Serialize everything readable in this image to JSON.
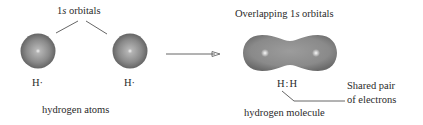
{
  "left_panel": {
    "orbital_label_prefix": "1",
    "orbital_label_italic": "s",
    "orbital_label_suffix": " orbitals",
    "atom_left_label": "H·",
    "atom_right_label": "H·",
    "caption": "hydrogen atoms"
  },
  "right_panel": {
    "overlap_label_prefix": "Overlapping 1",
    "overlap_label_italic": "s",
    "overlap_label_suffix": " orbitals",
    "molecule_formula": "H:H",
    "shared_pair_line1": "Shared pair",
    "shared_pair_line2": "of electrons",
    "caption": "hydrogen molecule"
  },
  "colors": {
    "sphere_dark": "#5e5e5e",
    "sphere_mid": "#8a8a8a",
    "highlight": "#e6e6e6",
    "line": "#555555"
  }
}
